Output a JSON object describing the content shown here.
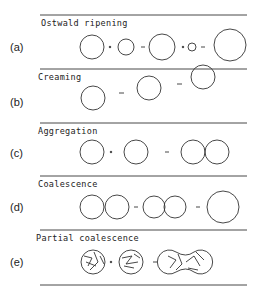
{
  "figure": {
    "panels": [
      {
        "label": "(a)",
        "title": "Ostwald ripening"
      },
      {
        "label": "(b)",
        "title": "Creaming"
      },
      {
        "label": "(c)",
        "title": "Aggregation"
      },
      {
        "label": "(d)",
        "title": "Coalescence"
      },
      {
        "label": "(e)",
        "title": "Partial coalescence"
      }
    ],
    "symbols": {
      "plus": "+",
      "arrow": "→"
    }
  }
}
